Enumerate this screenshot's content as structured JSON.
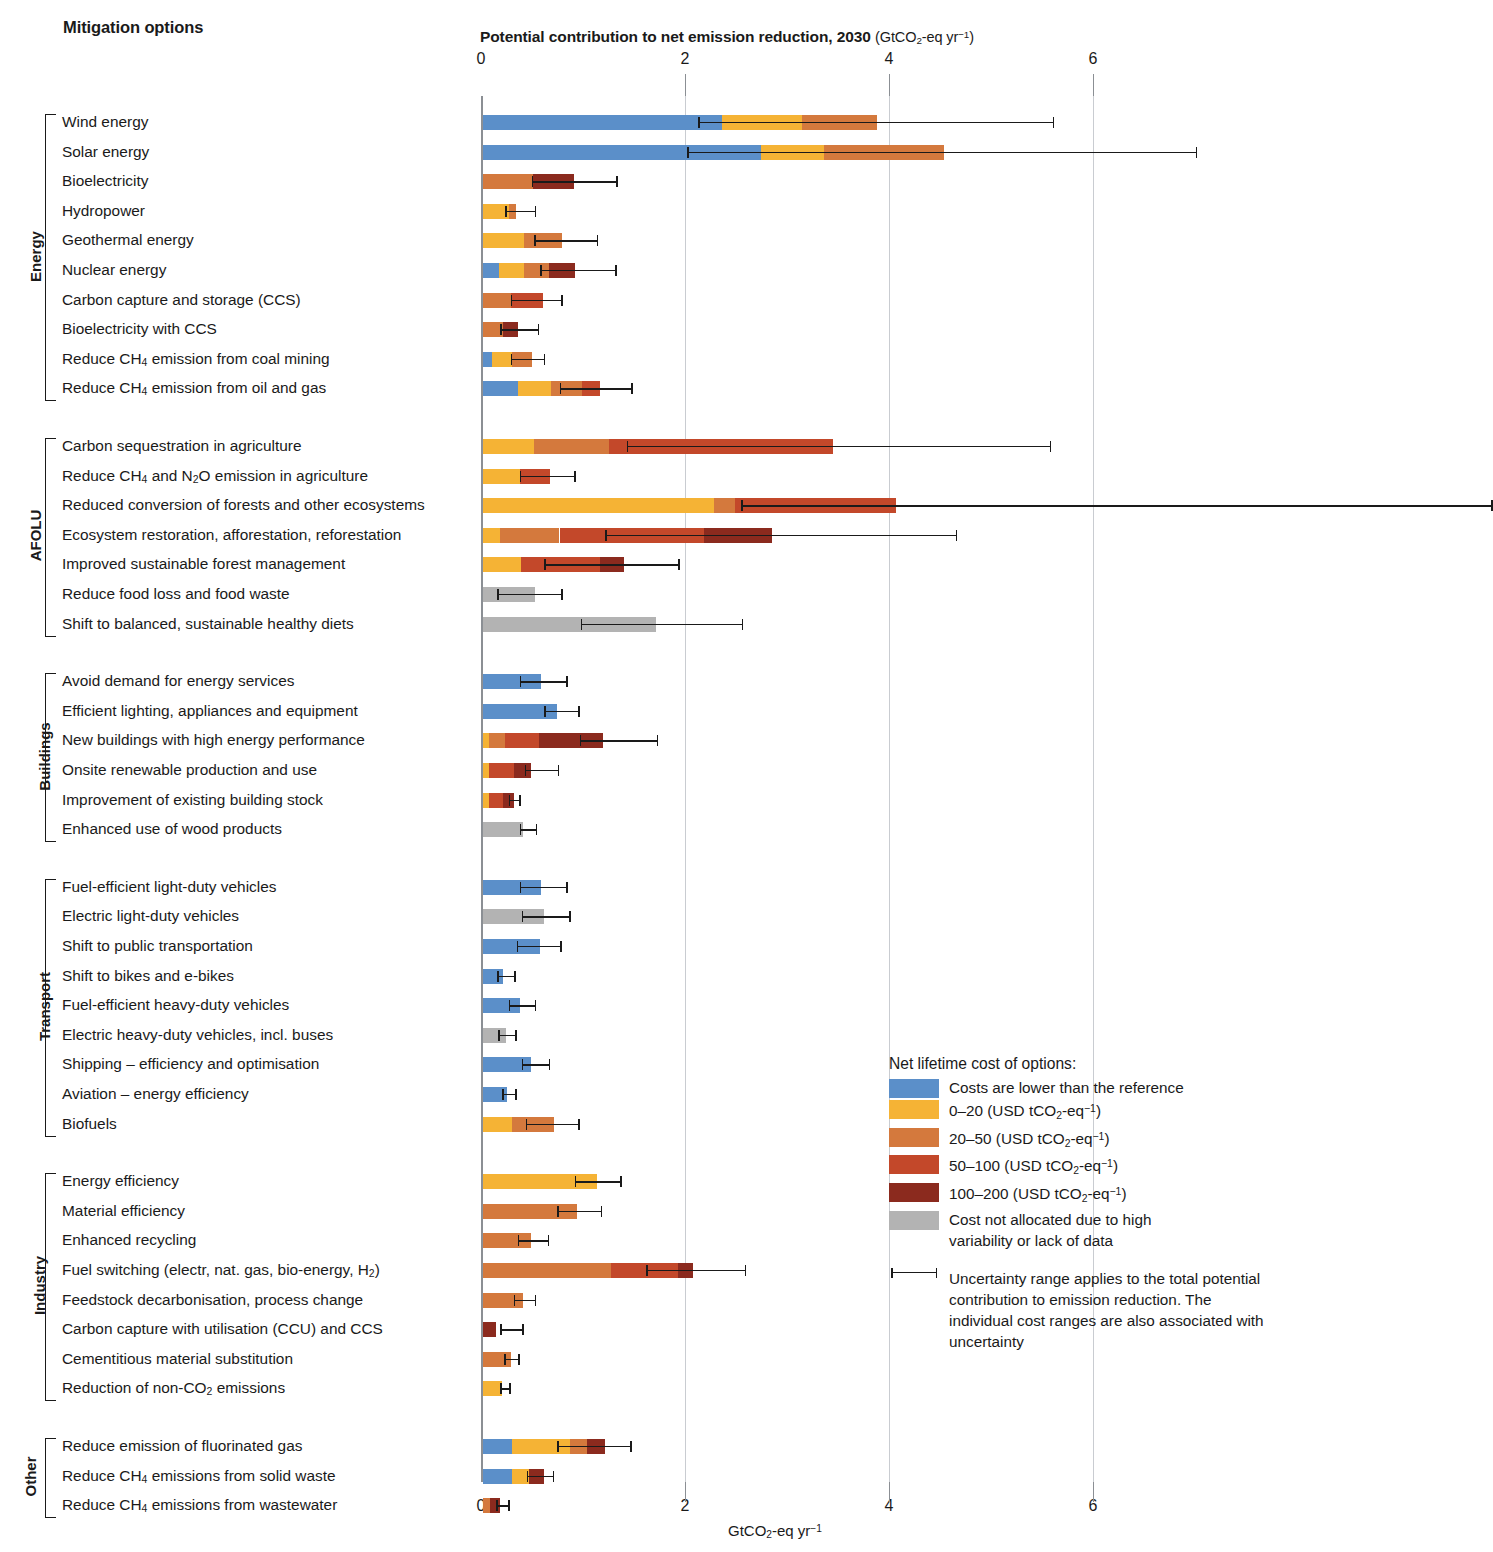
{
  "header": {
    "mitigation_options": "Mitigation options",
    "axis_title_main": "Potential contribution to net emission reduction, 2030",
    "axis_title_unit": "(GtCO2-eq yr-1)",
    "bottom_axis_label": "GtCO2-eq yr-1"
  },
  "legend": {
    "title": "Net lifetime cost of options:",
    "items": [
      {
        "label": "Costs are lower than the reference",
        "color": "#5B8FC9"
      },
      {
        "label": "0–20 (USD tCO2-eq-1)",
        "color": "#F5B335"
      },
      {
        "label": "20–50 (USD tCO2-eq-1)",
        "color": "#D4793D"
      },
      {
        "label": "50–100 (USD tCO2-eq-1)",
        "color": "#C3482A"
      },
      {
        "label": "100–200 (USD tCO2-eq-1)",
        "color": "#8B2A1E"
      },
      {
        "label": "Cost not allocated due to high",
        "label2": "variability or lack of data",
        "color": "#B3B3B3"
      }
    ],
    "uncertainty_note": "Uncertainty range applies to the total potential contribution to emission reduction. The individual cost ranges are also associated with uncertainty"
  },
  "chart_data": {
    "type": "bar",
    "orientation": "horizontal",
    "stacked": true,
    "xlabel": "GtCO2-eq yr-1",
    "ylabel": "Mitigation options",
    "xlim": [
      0,
      6.0
    ],
    "xticks": [
      0,
      2,
      4,
      6
    ],
    "grid": true,
    "legend_position": "bottom-right",
    "series": [
      {
        "name": "Costs are lower than the reference",
        "color": "#5B8FC9"
      },
      {
        "name": "0–20 (USD tCO2-eq-1)",
        "color": "#F5B335"
      },
      {
        "name": "20–50 (USD tCO2-eq-1)",
        "color": "#D4793D"
      },
      {
        "name": "50–100 (USD tCO2-eq-1)",
        "color": "#C3482A"
      },
      {
        "name": "100–200 (USD tCO2-eq-1)",
        "color": "#8B2A1E"
      },
      {
        "name": "Cost not allocated",
        "color": "#B3B3B3"
      }
    ],
    "groups": [
      {
        "name": "Energy",
        "rows": [
          {
            "label": "Wind energy",
            "segments": [
              {
                "s": 0,
                "v": 2.34
              },
              {
                "s": 1,
                "v": 0.79
              },
              {
                "s": 2,
                "v": 0.73
              }
            ],
            "total": 3.86,
            "err": [
              2.11,
              5.6
            ]
          },
          {
            "label": "Solar energy",
            "segments": [
              {
                "s": 0,
                "v": 2.73
              },
              {
                "s": 1,
                "v": 0.61
              },
              {
                "s": 2,
                "v": 1.18
              }
            ],
            "total": 4.52,
            "err": [
              2.0,
              7.0
            ]
          },
          {
            "label": "Bioelectricity",
            "segments": [
              {
                "s": 2,
                "v": 0.49
              },
              {
                "s": 4,
                "v": 0.4
              }
            ],
            "total": 0.89,
            "err": [
              0.48,
              1.32
            ]
          },
          {
            "label": "Hydropower",
            "segments": [
              {
                "s": 1,
                "v": 0.25
              },
              {
                "s": 2,
                "v": 0.07
              }
            ],
            "total": 0.32,
            "err": [
              0.22,
              0.52
            ]
          },
          {
            "label": "Geothermal energy",
            "segments": [
              {
                "s": 1,
                "v": 0.4
              },
              {
                "s": 2,
                "v": 0.37
              }
            ],
            "total": 0.77,
            "err": [
              0.5,
              1.13
            ]
          },
          {
            "label": "Nuclear energy",
            "segments": [
              {
                "s": 0,
                "v": 0.16
              },
              {
                "s": 1,
                "v": 0.24
              },
              {
                "s": 2,
                "v": 0.25
              },
              {
                "s": 4,
                "v": 0.25
              }
            ],
            "total": 0.9,
            "err": [
              0.56,
              1.31
            ]
          },
          {
            "label": "Carbon capture and storage (CCS)",
            "segments": [
              {
                "s": 2,
                "v": 0.27
              },
              {
                "s": 3,
                "v": 0.32
              }
            ],
            "total": 0.59,
            "err": [
              0.27,
              0.78
            ]
          },
          {
            "label": "Bioelectricity with CCS",
            "segments": [
              {
                "s": 2,
                "v": 0.2
              },
              {
                "s": 4,
                "v": 0.14
              }
            ],
            "total": 0.34,
            "err": [
              0.17,
              0.55
            ]
          },
          {
            "label": "Reduce CH4 emission from coal mining",
            "segments": [
              {
                "s": 0,
                "v": 0.09
              },
              {
                "s": 1,
                "v": 0.19
              },
              {
                "s": 2,
                "v": 0.2
              }
            ],
            "total": 0.48,
            "err": [
              0.27,
              0.61
            ]
          },
          {
            "label": "Reduce CH4 emission from oil and gas",
            "segments": [
              {
                "s": 0,
                "v": 0.34
              },
              {
                "s": 1,
                "v": 0.33
              },
              {
                "s": 2,
                "v": 0.3
              },
              {
                "s": 3,
                "v": 0.18
              }
            ],
            "total": 1.15,
            "err": [
              0.75,
              1.47
            ]
          }
        ]
      },
      {
        "name": "AFOLU",
        "rows": [
          {
            "label": "Carbon sequestration in agriculture",
            "segments": [
              {
                "s": 1,
                "v": 0.5
              },
              {
                "s": 2,
                "v": 0.74
              },
              {
                "s": 3,
                "v": 2.19
              }
            ],
            "total": 3.43,
            "err": [
              1.41,
              5.57
            ]
          },
          {
            "label": "Reduce CH4 and N2O emission in agriculture",
            "segments": [
              {
                "s": 1,
                "v": 0.36
              },
              {
                "s": 3,
                "v": 0.3
              }
            ],
            "total": 0.66,
            "err": [
              0.36,
              0.91
            ]
          },
          {
            "label": "Reduced conversion of forests and other ecosystems",
            "segments": [
              {
                "s": 1,
                "v": 2.26
              },
              {
                "s": 2,
                "v": 0.21
              },
              {
                "s": 3,
                "v": 1.58
              }
            ],
            "total": 4.05,
            "err": [
              2.53,
              9.9
            ]
          },
          {
            "label": "Ecosystem restoration, afforestation, reforestation",
            "segments": [
              {
                "s": 1,
                "v": 0.17
              },
              {
                "s": 2,
                "v": 0.58
              },
              {
                "s": 3,
                "v": 1.42
              },
              {
                "s": 4,
                "v": 0.66
              }
            ],
            "total": 2.83,
            "err": [
              1.2,
              4.65
            ]
          },
          {
            "label": "Improved sustainable forest management",
            "segments": [
              {
                "s": 1,
                "v": 0.37
              },
              {
                "s": 3,
                "v": 0.78
              },
              {
                "s": 4,
                "v": 0.23
              }
            ],
            "total": 1.38,
            "err": [
              0.6,
              1.93
            ]
          },
          {
            "label": "Reduce food loss and food waste",
            "segments": [
              {
                "s": 5,
                "v": 0.51
              }
            ],
            "total": 0.51,
            "err": [
              0.14,
              0.78
            ]
          },
          {
            "label": "Shift to balanced, sustainable healthy diets",
            "segments": [
              {
                "s": 5,
                "v": 1.7
              }
            ],
            "total": 1.7,
            "err": [
              0.96,
              2.55
            ]
          }
        ]
      },
      {
        "name": "Buildings",
        "rows": [
          {
            "label": "Avoid demand for energy services",
            "segments": [
              {
                "s": 0,
                "v": 0.57
              }
            ],
            "total": 0.57,
            "err": [
              0.36,
              0.83
            ]
          },
          {
            "label": "Efficient lighting, appliances and equipment",
            "segments": [
              {
                "s": 0,
                "v": 0.73
              }
            ],
            "total": 0.73,
            "err": [
              0.6,
              0.95
            ]
          },
          {
            "label": "New buildings with high energy performance",
            "segments": [
              {
                "s": 1,
                "v": 0.06
              },
              {
                "s": 2,
                "v": 0.16
              },
              {
                "s": 3,
                "v": 0.33
              },
              {
                "s": 4,
                "v": 0.63
              }
            ],
            "total": 1.18,
            "err": [
              0.95,
              1.72
            ]
          },
          {
            "label": "Onsite renewable production and use",
            "segments": [
              {
                "s": 1,
                "v": 0.06
              },
              {
                "s": 3,
                "v": 0.24
              },
              {
                "s": 4,
                "v": 0.17
              }
            ],
            "total": 0.47,
            "err": [
              0.41,
              0.75
            ]
          },
          {
            "label": "Improvement of existing building stock",
            "segments": [
              {
                "s": 1,
                "v": 0.06
              },
              {
                "s": 3,
                "v": 0.14
              },
              {
                "s": 4,
                "v": 0.1
              }
            ],
            "total": 0.3,
            "err": [
              0.25,
              0.37
            ]
          },
          {
            "label": "Enhanced use of wood products",
            "segments": [
              {
                "s": 5,
                "v": 0.39
              }
            ],
            "total": 0.39,
            "err": [
              0.36,
              0.53
            ]
          }
        ]
      },
      {
        "name": "Transport",
        "rows": [
          {
            "label": "Fuel-efficient light-duty vehicles",
            "segments": [
              {
                "s": 0,
                "v": 0.57
              }
            ],
            "total": 0.57,
            "err": [
              0.36,
              0.83
            ]
          },
          {
            "label": "Electric light-duty vehicles",
            "segments": [
              {
                "s": 5,
                "v": 0.6
              }
            ],
            "total": 0.6,
            "err": [
              0.38,
              0.86
            ]
          },
          {
            "label": "Shift to public transportation",
            "segments": [
              {
                "s": 0,
                "v": 0.56
              }
            ],
            "total": 0.56,
            "err": [
              0.33,
              0.77
            ]
          },
          {
            "label": "Shift to bikes and e-bikes",
            "segments": [
              {
                "s": 0,
                "v": 0.2
              }
            ],
            "total": 0.2,
            "err": [
              0.14,
              0.32
            ]
          },
          {
            "label": "Fuel-efficient heavy-duty vehicles",
            "segments": [
              {
                "s": 0,
                "v": 0.36
              }
            ],
            "total": 0.36,
            "err": [
              0.25,
              0.52
            ]
          },
          {
            "label": "Electric heavy-duty vehicles, incl. buses",
            "segments": [
              {
                "s": 5,
                "v": 0.23
              }
            ],
            "total": 0.23,
            "err": [
              0.15,
              0.33
            ]
          },
          {
            "label": "Shipping – efficiency and optimisation",
            "segments": [
              {
                "s": 0,
                "v": 0.47
              }
            ],
            "total": 0.47,
            "err": [
              0.38,
              0.66
            ]
          },
          {
            "label": "Aviation – energy efficiency",
            "segments": [
              {
                "s": 0,
                "v": 0.24
              }
            ],
            "total": 0.24,
            "err": [
              0.19,
              0.33
            ]
          },
          {
            "label": "Biofuels",
            "segments": [
              {
                "s": 1,
                "v": 0.28
              },
              {
                "s": 2,
                "v": 0.42
              }
            ],
            "total": 0.7,
            "err": [
              0.42,
              0.95
            ]
          }
        ]
      },
      {
        "name": "Industry",
        "rows": [
          {
            "label": "Energy efficiency",
            "segments": [
              {
                "s": 1,
                "v": 1.12
              }
            ],
            "total": 1.12,
            "err": [
              0.9,
              1.36
            ]
          },
          {
            "label": "Material efficiency",
            "segments": [
              {
                "s": 2,
                "v": 0.92
              }
            ],
            "total": 0.92,
            "err": [
              0.73,
              1.17
            ]
          },
          {
            "label": "Enhanced recycling",
            "segments": [
              {
                "s": 2,
                "v": 0.47
              }
            ],
            "total": 0.47,
            "err": [
              0.34,
              0.65
            ]
          },
          {
            "label": "Fuel switching (electr, nat. gas, bio-energy, H2)",
            "segments": [
              {
                "s": 2,
                "v": 1.25
              },
              {
                "s": 3,
                "v": 0.66
              },
              {
                "s": 4,
                "v": 0.15
              }
            ],
            "total": 2.06,
            "err": [
              1.6,
              2.58
            ]
          },
          {
            "label": "Feedstock decarbonisation, process change",
            "segments": [
              {
                "s": 2,
                "v": 0.39
              }
            ],
            "total": 0.39,
            "err": [
              0.3,
              0.52
            ]
          },
          {
            "label": "Carbon capture with utilisation (CCU) and CCS",
            "segments": [
              {
                "s": 4,
                "v": 0.13
              }
            ],
            "total": 0.13,
            "err": [
              0.17,
              0.4
            ]
          },
          {
            "label": "Cementitious material substitution",
            "segments": [
              {
                "s": 2,
                "v": 0.27
              }
            ],
            "total": 0.27,
            "err": [
              0.21,
              0.36
            ]
          },
          {
            "label": "Reduction of non-CO2 emissions",
            "segments": [
              {
                "s": 1,
                "v": 0.19
              }
            ],
            "total": 0.19,
            "err": [
              0.17,
              0.27
            ]
          }
        ]
      },
      {
        "name": "Other",
        "rows": [
          {
            "label": "Reduce emission of fluorinated gas",
            "segments": [
              {
                "s": 0,
                "v": 0.28
              },
              {
                "s": 1,
                "v": 0.57
              },
              {
                "s": 2,
                "v": 0.17
              },
              {
                "s": 4,
                "v": 0.18
              }
            ],
            "total": 1.2,
            "err": [
              0.73,
              1.46
            ]
          },
          {
            "label": "Reduce CH4 emissions from solid waste",
            "segments": [
              {
                "s": 0,
                "v": 0.28
              },
              {
                "s": 1,
                "v": 0.17
              },
              {
                "s": 4,
                "v": 0.15
              }
            ],
            "total": 0.6,
            "err": [
              0.43,
              0.7
            ]
          },
          {
            "label": "Reduce CH4 emissions from wastewater",
            "segments": [
              {
                "s": 2,
                "v": 0.07
              },
              {
                "s": 4,
                "v": 0.1
              }
            ],
            "total": 0.17,
            "err": [
              0.13,
              0.26
            ]
          }
        ]
      }
    ]
  }
}
